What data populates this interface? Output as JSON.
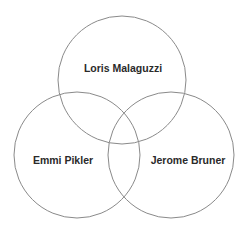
{
  "diagram": {
    "type": "venn",
    "sets": [
      {
        "label": "Loris Malaguzzi",
        "cx": 122,
        "cy": 80,
        "r": 64,
        "label_x": 123,
        "label_y": 68
      },
      {
        "label": "Emmi Pikler",
        "cx": 77,
        "cy": 155,
        "r": 63,
        "label_x": 63,
        "label_y": 160
      },
      {
        "label": "Jerome Bruner",
        "cx": 171,
        "cy": 155,
        "r": 63,
        "label_x": 188,
        "label_y": 160
      }
    ],
    "stroke_color": "#8a8a8a",
    "text_color": "#2a2a2a"
  }
}
